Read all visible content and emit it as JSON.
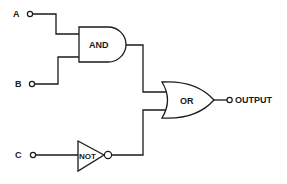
{
  "diagram": {
    "type": "logic-circuit",
    "inputs": [
      {
        "id": "A",
        "label": "A"
      },
      {
        "id": "B",
        "label": "B"
      },
      {
        "id": "C",
        "label": "C"
      }
    ],
    "gates": [
      {
        "id": "and",
        "label": "AND",
        "inputs": [
          "A",
          "B"
        ]
      },
      {
        "id": "not",
        "label": "NOT",
        "inputs": [
          "C"
        ]
      },
      {
        "id": "or",
        "label": "OR",
        "inputs": [
          "and",
          "not"
        ]
      }
    ],
    "output": {
      "label": "OUTPUT",
      "source": "or"
    },
    "colors": {
      "line": "#1a1a1a",
      "background": "#ffffff"
    }
  }
}
